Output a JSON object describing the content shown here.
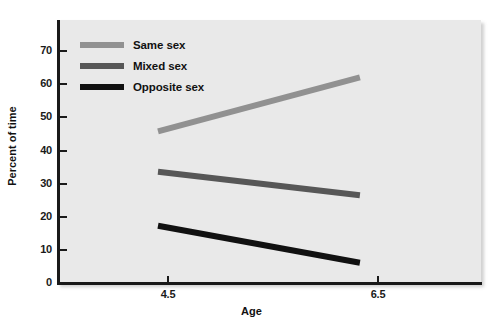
{
  "chart_data": {
    "type": "line",
    "title": "",
    "xlabel": "Age",
    "ylabel": "Percent of time",
    "x": [
      4.5,
      6.5
    ],
    "xtick_labels": [
      "4.5",
      "6.5"
    ],
    "ytick_labels": [
      "0",
      "10",
      "20",
      "30",
      "40",
      "50",
      "60",
      "70"
    ],
    "yticks": [
      0,
      10,
      20,
      30,
      40,
      50,
      60,
      70
    ],
    "ylim": [
      0,
      78
    ],
    "xlim": [
      3.5,
      7.7
    ],
    "grid": false,
    "legend_position": "top-left",
    "plot_background": "#e9e9e9",
    "series": [
      {
        "name": "Same sex",
        "values": [
          45,
          61
        ],
        "color": "#919191"
      },
      {
        "name": "Mixed sex",
        "values": [
          33,
          26
        ],
        "color": "#575757"
      },
      {
        "name": "Opposite sex",
        "values": [
          17,
          6
        ],
        "color": "#111111"
      }
    ]
  },
  "legend": {
    "items": [
      {
        "label": "Same sex",
        "color": "#919191"
      },
      {
        "label": "Mixed sex",
        "color": "#575757"
      },
      {
        "label": "Opposite sex",
        "color": "#111111"
      }
    ]
  },
  "axes": {
    "y_title": "Percent of time",
    "x_title": "Age",
    "y_ticks": [
      "70",
      "60",
      "50",
      "40",
      "30",
      "20",
      "10",
      "0"
    ],
    "x_ticks": [
      "4.5",
      "6.5"
    ]
  }
}
